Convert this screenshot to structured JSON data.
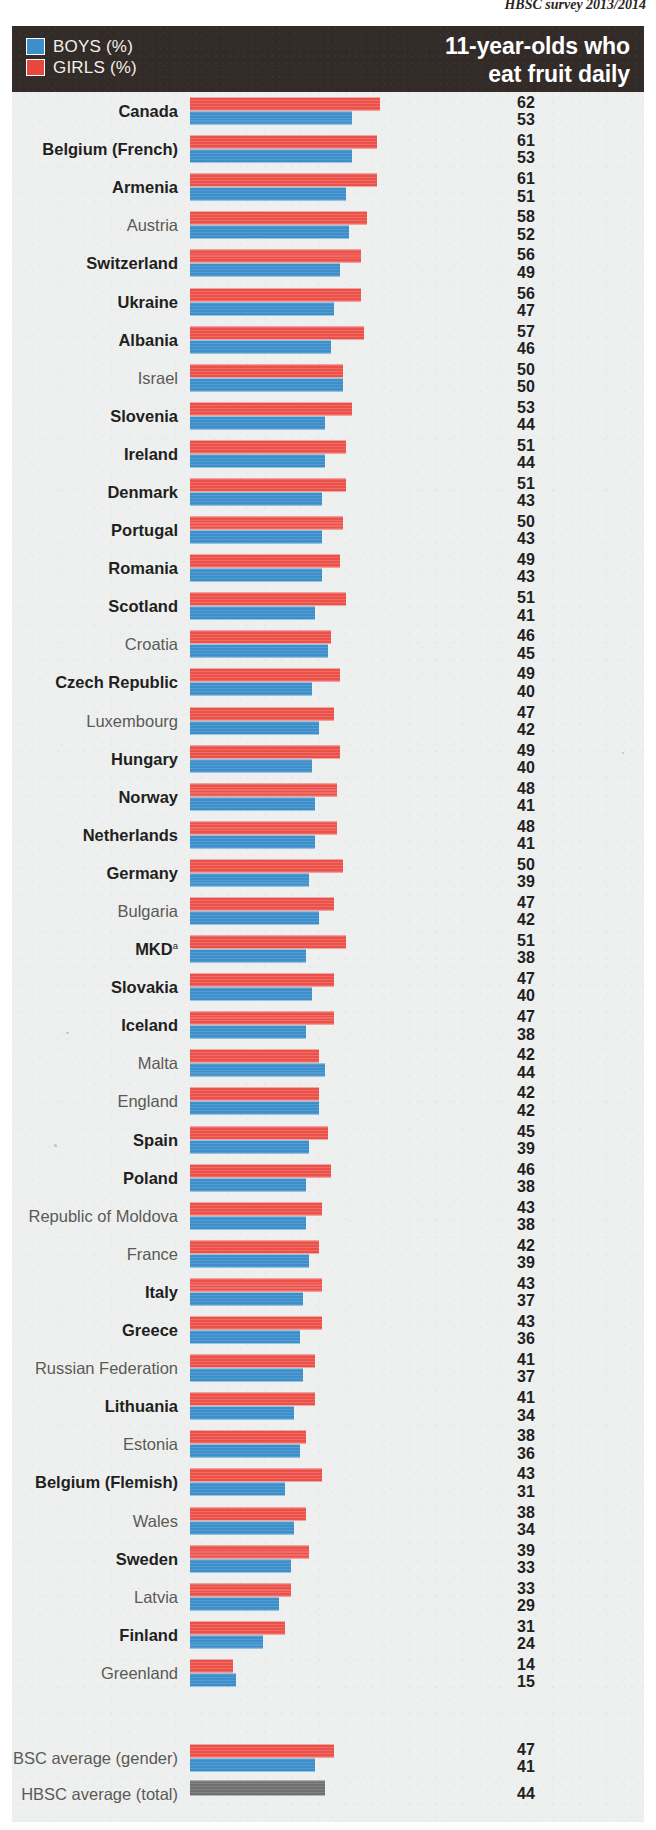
{
  "source_note": "HBSC survey 2013/2014",
  "header": {
    "title_line1": "11-year-olds who",
    "title_line2": "eat fruit daily",
    "legend": [
      {
        "key": "boys",
        "label": "BOYS (%)",
        "color": "#3d8fcb"
      },
      {
        "key": "girls",
        "label": "GIRLS (%)",
        "color": "#ec5149"
      }
    ]
  },
  "colors": {
    "boys": "#3d8fcb",
    "girls": "#ec5149",
    "total": "#6f6f6f",
    "header_band": "#322b28",
    "panel_background": "#eef0f0"
  },
  "footnote_marker": "a",
  "chart_data": {
    "type": "bar",
    "orientation": "horizontal",
    "title": "11-year-olds who eat fruit daily",
    "subtitle": "HBSC survey 2013/2014",
    "xlabel": "%",
    "ylabel": "",
    "xlim": [
      0,
      62
    ],
    "grid": false,
    "legend_position": "top-left",
    "value_label_precision": 0,
    "note": "Countries ordered by descending boys' value; girls (red) bar drawn above boys (blue) bar in each pair.",
    "series": [
      {
        "name": "GIRLS (%)",
        "color": "#ec5149"
      },
      {
        "name": "BOYS (%)",
        "color": "#3d8fcb"
      }
    ],
    "categories": [
      "Canada",
      "Belgium (French)",
      "Armenia",
      "Austria",
      "Switzerland",
      "Ukraine",
      "Albania",
      "Israel",
      "Slovenia",
      "Ireland",
      "Denmark",
      "Portugal",
      "Romania",
      "Scotland",
      "Croatia",
      "Czech Republic",
      "Luxembourg",
      "Hungary",
      "Norway",
      "Netherlands",
      "Germany",
      "Bulgaria",
      "MKD",
      "Slovakia",
      "Iceland",
      "Malta",
      "England",
      "Spain",
      "Poland",
      "Republic of Moldova",
      "France",
      "Italy",
      "Greece",
      "Russian Federation",
      "Lithuania",
      "Estonia",
      "Belgium (Flemish)",
      "Wales",
      "Sweden",
      "Latvia",
      "Finland",
      "Greenland"
    ],
    "girls": [
      62,
      61,
      61,
      58,
      56,
      56,
      57,
      50,
      53,
      51,
      51,
      50,
      49,
      51,
      46,
      49,
      47,
      49,
      48,
      48,
      50,
      47,
      51,
      47,
      47,
      42,
      42,
      45,
      46,
      43,
      42,
      43,
      43,
      41,
      41,
      38,
      43,
      38,
      39,
      33,
      31,
      14
    ],
    "boys": [
      53,
      53,
      51,
      52,
      49,
      47,
      46,
      50,
      44,
      44,
      43,
      43,
      43,
      41,
      45,
      40,
      42,
      40,
      41,
      41,
      39,
      42,
      38,
      40,
      38,
      44,
      42,
      39,
      38,
      38,
      39,
      37,
      36,
      37,
      34,
      36,
      31,
      34,
      33,
      29,
      24,
      15
    ],
    "averages": [
      {
        "label": "HBSC average (gender)",
        "type": "gender",
        "girls": 47,
        "boys": 41
      },
      {
        "label": "HBSC average (total)",
        "type": "total",
        "total": 44
      }
    ]
  },
  "rows": [
    {
      "name": "Canada",
      "girls": 62,
      "boys": 53,
      "bold": true
    },
    {
      "name": "Belgium (French)",
      "girls": 61,
      "boys": 53,
      "bold": true
    },
    {
      "name": "Armenia",
      "girls": 61,
      "boys": 51,
      "bold": true
    },
    {
      "name": "Austria",
      "girls": 58,
      "boys": 52,
      "bold": false
    },
    {
      "name": "Switzerland",
      "girls": 56,
      "boys": 49,
      "bold": true
    },
    {
      "name": "Ukraine",
      "girls": 56,
      "boys": 47,
      "bold": true
    },
    {
      "name": "Albania",
      "girls": 57,
      "boys": 46,
      "bold": true
    },
    {
      "name": "Israel",
      "girls": 50,
      "boys": 50,
      "bold": false
    },
    {
      "name": "Slovenia",
      "girls": 53,
      "boys": 44,
      "bold": true
    },
    {
      "name": "Ireland",
      "girls": 51,
      "boys": 44,
      "bold": true
    },
    {
      "name": "Denmark",
      "girls": 51,
      "boys": 43,
      "bold": true
    },
    {
      "name": "Portugal",
      "girls": 50,
      "boys": 43,
      "bold": true
    },
    {
      "name": "Romania",
      "girls": 49,
      "boys": 43,
      "bold": true
    },
    {
      "name": "Scotland",
      "girls": 51,
      "boys": 41,
      "bold": true
    },
    {
      "name": "Croatia",
      "girls": 46,
      "boys": 45,
      "bold": false
    },
    {
      "name": "Czech Republic",
      "girls": 49,
      "boys": 40,
      "bold": true
    },
    {
      "name": "Luxembourg",
      "girls": 47,
      "boys": 42,
      "bold": false
    },
    {
      "name": "Hungary",
      "girls": 49,
      "boys": 40,
      "bold": true
    },
    {
      "name": "Norway",
      "girls": 48,
      "boys": 41,
      "bold": true
    },
    {
      "name": "Netherlands",
      "girls": 48,
      "boys": 41,
      "bold": true
    },
    {
      "name": "Germany",
      "girls": 50,
      "boys": 39,
      "bold": true
    },
    {
      "name": "Bulgaria",
      "girls": 47,
      "boys": 42,
      "bold": false
    },
    {
      "name": "MKD",
      "girls": 51,
      "boys": 38,
      "bold": true,
      "sup": "a"
    },
    {
      "name": "Slovakia",
      "girls": 47,
      "boys": 40,
      "bold": true
    },
    {
      "name": "Iceland",
      "girls": 47,
      "boys": 38,
      "bold": true
    },
    {
      "name": "Malta",
      "girls": 42,
      "boys": 44,
      "bold": false
    },
    {
      "name": "England",
      "girls": 42,
      "boys": 42,
      "bold": false
    },
    {
      "name": "Spain",
      "girls": 45,
      "boys": 39,
      "bold": true
    },
    {
      "name": "Poland",
      "girls": 46,
      "boys": 38,
      "bold": true
    },
    {
      "name": "Republic of Moldova",
      "girls": 43,
      "boys": 38,
      "bold": false
    },
    {
      "name": "France",
      "girls": 42,
      "boys": 39,
      "bold": false
    },
    {
      "name": "Italy",
      "girls": 43,
      "boys": 37,
      "bold": true
    },
    {
      "name": "Greece",
      "girls": 43,
      "boys": 36,
      "bold": true
    },
    {
      "name": "Russian Federation",
      "girls": 41,
      "boys": 37,
      "bold": false
    },
    {
      "name": "Lithuania",
      "girls": 41,
      "boys": 34,
      "bold": true
    },
    {
      "name": "Estonia",
      "girls": 38,
      "boys": 36,
      "bold": false
    },
    {
      "name": "Belgium (Flemish)",
      "girls": 43,
      "boys": 31,
      "bold": true
    },
    {
      "name": "Wales",
      "girls": 38,
      "boys": 34,
      "bold": false
    },
    {
      "name": "Sweden",
      "girls": 39,
      "boys": 33,
      "bold": true
    },
    {
      "name": "Latvia",
      "girls": 33,
      "boys": 29,
      "bold": false
    },
    {
      "name": "Finland",
      "girls": 31,
      "boys": 24,
      "bold": true
    },
    {
      "name": "Greenland",
      "girls": 14,
      "boys": 15,
      "bold": false
    }
  ],
  "average_rows": [
    {
      "name": "HBSC average (gender)",
      "girls": 47,
      "boys": 41,
      "kind": "gender"
    },
    {
      "name": "HBSC average (total)",
      "total": 44,
      "kind": "total"
    }
  ],
  "scale": {
    "px_per_unit": 3.06,
    "bar_origin_px": 178
  }
}
